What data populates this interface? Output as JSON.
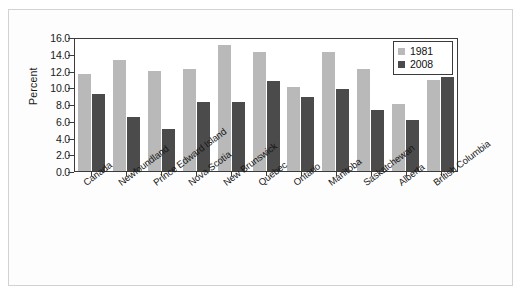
{
  "chart_data": {
    "type": "bar",
    "title": "",
    "subtitle": "",
    "xlabel": "",
    "ylabel": "Percent",
    "ylim": [
      0.0,
      16.0
    ],
    "ytick_step": 2.0,
    "ytick_labels": [
      "16.0",
      "14.0",
      "12.0",
      "10.0",
      "8.0",
      "6.0",
      "4.0",
      "2.0",
      "0.0"
    ],
    "ytick_values": [
      16.0,
      14.0,
      12.0,
      10.0,
      8.0,
      6.0,
      4.0,
      2.0,
      0.0
    ],
    "grid": false,
    "legend_position": "top-right",
    "categories": [
      "Canada",
      "Newfoundland",
      "Prince Edward Island",
      "Nova Scotia",
      "New Brunswick",
      "Quebec",
      "Ontario",
      "Manitoba",
      "Saskatchewan",
      "Alberta",
      "British Columbia"
    ],
    "series": [
      {
        "name": "1981",
        "color": "#b9b9b9",
        "values": [
          11.6,
          13.3,
          12.0,
          12.2,
          15.0,
          14.2,
          10.0,
          14.2,
          12.2,
          8.0,
          10.9
        ]
      },
      {
        "name": "2008",
        "color": "#4b4b4b",
        "values": [
          9.2,
          6.5,
          5.0,
          8.2,
          8.2,
          10.7,
          8.8,
          9.8,
          7.3,
          6.1,
          11.2
        ]
      }
    ]
  },
  "legend": {
    "items": [
      {
        "label": "1981",
        "color": "#b9b9b9"
      },
      {
        "label": "2008",
        "color": "#4b4b4b"
      }
    ]
  },
  "axis": {
    "y_title": "Percent"
  }
}
